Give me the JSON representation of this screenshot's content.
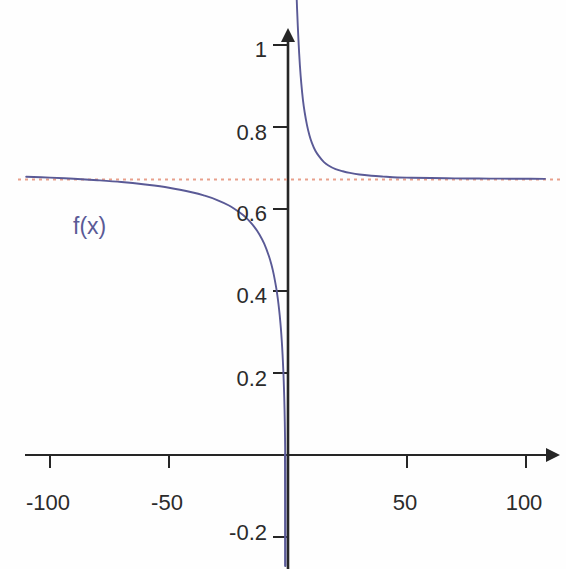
{
  "chart_data": {
    "type": "line",
    "title": "",
    "subtitle": "",
    "xlabel": "",
    "ylabel": "",
    "xlim": [
      -110,
      108
    ],
    "ylim": [
      -0.26,
      1.12
    ],
    "grid": false,
    "legend_position": "inline-annotation",
    "annotations": [
      {
        "name": "curve-label",
        "text": "f(x)",
        "x": -95,
        "y": 0.555,
        "color": "#5a5a96"
      }
    ],
    "x_ticks": [
      {
        "value": -100,
        "label": "-100"
      },
      {
        "value": -50,
        "label": "-50"
      },
      {
        "value": 50,
        "label": "50"
      },
      {
        "value": 100,
        "label": "100"
      }
    ],
    "y_ticks": [
      {
        "value": 1,
        "label": "1"
      },
      {
        "value": 0.8,
        "label": "0.8"
      },
      {
        "value": 0.6,
        "label": "0.6"
      },
      {
        "value": 0.4,
        "label": "0.4"
      },
      {
        "value": 0.2,
        "label": "0.2"
      },
      {
        "value": -0.2,
        "label": "-0.2"
      }
    ],
    "axes": {
      "x_axis_y_value": 0,
      "y_axis_x_value": 0,
      "x_axis_arrow": true,
      "y_axis_arrow": true,
      "axis_color": "#262626"
    },
    "series": [
      {
        "name": "f(x)",
        "type": "line",
        "color": "#5a5a96",
        "linestyle": "solid",
        "linewidth": 1.8,
        "vertical_asymptote": -1.1,
        "horizontal_asymptote": 0.672,
        "branches": [
          {
            "name": "left-branch",
            "x": [
              -110,
              -100,
              -90,
              -80,
              -70,
              -60,
              -50,
              -40,
              -35,
              -30,
              -25,
              -20,
              -18,
              -16,
              -14,
              -12,
              -10,
              -8,
              -7,
              -6,
              -5,
              -4.5,
              -4,
              -3.5,
              -3,
              -2.6,
              -2.3,
              -2.0,
              -1.8,
              -1.6,
              -1.45,
              -1.35,
              -1.28,
              -1.22,
              -1.18
            ],
            "y": [
              0.6788,
              0.6765,
              0.6737,
              0.6702,
              0.6659,
              0.6597,
              0.6519,
              0.6403,
              0.6325,
              0.6225,
              0.6092,
              0.5904,
              0.5808,
              0.5693,
              0.5553,
              0.5378,
              0.5153,
              0.4848,
              0.465,
              0.4406,
              0.4094,
              0.3903,
              0.3681,
              0.3416,
              0.3093,
              0.2769,
              0.2467,
              0.21,
              0.1806,
              0.1446,
              0.1105,
              0.0808,
              0.0548,
              0.0258,
              0.0005
            ]
          },
          {
            "name": "left-branch-plunge",
            "x": [
              -1.18,
              -1.16,
              -1.15,
              -1.14,
              -1.135,
              -1.13,
              -1.128
            ],
            "y": [
              0.0005,
              -0.03,
              -0.06,
              -0.11,
              -0.16,
              -0.22,
              -0.27
            ]
          },
          {
            "name": "right-branch",
            "x": [
              3.6,
              3.8,
              4.1,
              4.5,
              5,
              5.6,
              6.3,
              7,
              8,
              9,
              10,
              11.5,
              13,
              15,
              17,
              20,
              23,
              26,
              30,
              35,
              40,
              46,
              52,
              60,
              70,
              80,
              90,
              100,
              108
            ],
            "y": [
              1.122,
              1.09,
              1.048,
              1.0,
              0.95,
              0.905,
              0.865,
              0.836,
              0.804,
              0.78,
              0.762,
              0.742,
              0.729,
              0.715,
              0.706,
              0.697,
              0.692,
              0.688,
              0.684,
              0.681,
              0.679,
              0.677,
              0.6763,
              0.6755,
              0.6748,
              0.6743,
              0.674,
              0.6737,
              0.6735
            ]
          }
        ]
      },
      {
        "name": "horizontal-asymptote",
        "type": "line",
        "linestyle": "dotted",
        "color": "#e8a08c",
        "linewidth": 1.6,
        "y_value": 0.672,
        "x_range": [
          -110,
          108
        ]
      }
    ]
  },
  "accessibility": {
    "description": "Plot of f(x) with a vertical asymptote near x = 0 and a horizontal asymptote at about y = 0.67"
  }
}
